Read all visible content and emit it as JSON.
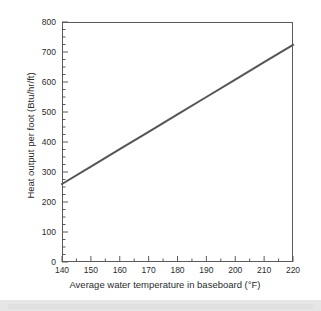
{
  "chart_data": {
    "type": "line",
    "title": "",
    "xlabel": "Average water temperature in baseboard (°F)",
    "ylabel": "Heat output per foot (Btu/hr/ft)",
    "xlim": [
      140,
      220
    ],
    "ylim": [
      0,
      800
    ],
    "xticks": [
      140,
      150,
      160,
      170,
      180,
      190,
      200,
      210,
      220
    ],
    "yticks": [
      0,
      100,
      200,
      300,
      400,
      500,
      600,
      700,
      800
    ],
    "xtick_labels": [
      "140",
      "150",
      "160",
      "170",
      "180",
      "190",
      "200",
      "210",
      "220"
    ],
    "ytick_labels": [
      "0",
      "100",
      "200",
      "300",
      "400",
      "500",
      "600",
      "700",
      "800"
    ],
    "x_minor_tick_interval": 5,
    "y_minor_tick_interval": 25,
    "grid": false,
    "legend": null,
    "series": [
      {
        "name": "Baseboard heat output",
        "color": "#555555",
        "line_width": 2,
        "x": [
          140,
          150,
          160,
          170,
          180,
          190,
          200,
          210,
          220
        ],
        "values": [
          260,
          318,
          376,
          434,
          492,
          550,
          608,
          666,
          724
        ]
      }
    ]
  },
  "figure": {
    "axis_color": "#5a5a5a",
    "background": "#ffffff",
    "scan_band_color": "#e6e6e6"
  }
}
